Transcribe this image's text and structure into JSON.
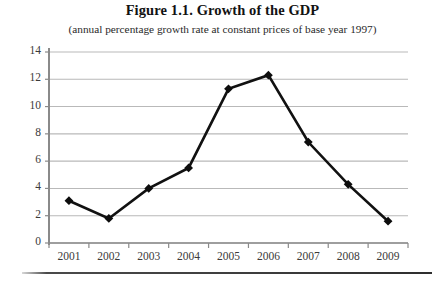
{
  "figure": {
    "title": "Figure 1.1. Growth of the GDP",
    "subtitle": "(annual percentage growth rate at constant prices of base year 1997)"
  },
  "colors": {
    "line": "#111111",
    "marker": "#0d0d0d",
    "gridline": "#b9b9b9",
    "axis": "#8a8a8a",
    "text": "#2a2a2a",
    "background": "#ffffff"
  },
  "axes": {
    "y_ticks": [
      "0",
      "2",
      "4",
      "6",
      "8",
      "10",
      "12",
      "14"
    ],
    "x_ticks": [
      "2001",
      "2002",
      "2003",
      "2004",
      "2005",
      "2006",
      "2007",
      "2008",
      "2009"
    ]
  },
  "chart_data": {
    "type": "line",
    "title": "Figure 1.1. Growth of the GDP",
    "subtitle": "(annual percentage growth rate at constant prices of base year 1997)",
    "xlabel": "",
    "ylabel": "",
    "categories": [
      "2001",
      "2002",
      "2003",
      "2004",
      "2005",
      "2006",
      "2007",
      "2008",
      "2009"
    ],
    "values": [
      3.1,
      1.8,
      4.0,
      5.5,
      11.3,
      12.3,
      7.4,
      4.3,
      1.6
    ],
    "ylim": [
      0,
      14
    ],
    "y_tick_step": 2,
    "grid": "horizontal",
    "legend": "none",
    "marker": "diamond",
    "series": [
      {
        "name": "GDP growth rate",
        "values": [
          3.1,
          1.8,
          4.0,
          5.5,
          11.3,
          12.3,
          7.4,
          4.3,
          1.6
        ]
      }
    ]
  }
}
